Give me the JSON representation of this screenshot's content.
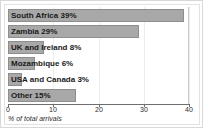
{
  "chart_data": {
    "type": "bar",
    "orientation": "horizontal",
    "title": "",
    "subtitle": "",
    "xlabel": "% of total arrivals",
    "ylabel": "",
    "categories": [
      "South Africa",
      "Zambia",
      "UK and Ireland",
      "Mozambique",
      "USA and Canada",
      "Other"
    ],
    "values": [
      39,
      29,
      8,
      6,
      3,
      15
    ],
    "bar_labels": [
      "South Africa 39%",
      "Zambia 29%",
      "UK and Ireland 8%",
      "Mozambique 6%",
      "USA and Canada 3%",
      "Other 15%"
    ],
    "xlim": [
      0,
      40
    ],
    "xticks": [
      0,
      10,
      20,
      30,
      40
    ],
    "xtick_labels": [
      "0",
      "10",
      "20",
      "30",
      "40"
    ],
    "grid": true,
    "legend": false,
    "legend_position": "none",
    "bar_color": "#a8a8a8",
    "bar_border_color": "#8e8e8e",
    "label_color": "#1a1a1a",
    "axis_color": "#6e6e6e",
    "gridline_color": "#ececec",
    "frame_color": "#d8d8d8",
    "background_color": "#ffffff"
  }
}
